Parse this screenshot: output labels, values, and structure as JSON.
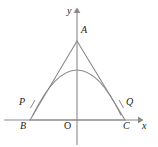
{
  "figure": {
    "type": "geometry-diagram",
    "canvas": {
      "width": 158,
      "height": 147,
      "background": "#ffffff"
    },
    "stroke_color": "#8a8a8a",
    "label_color": "#1a1a1a",
    "axes": {
      "x_axis": {
        "label": "x",
        "label_pos": {
          "x": 144,
          "y": 122
        },
        "line": {
          "x1": 4,
          "y1": 120,
          "x2": 140,
          "y2": 120
        },
        "arrow": "right"
      },
      "y_axis": {
        "label": "y",
        "label_pos": {
          "x": 67,
          "y": 8
        },
        "line": {
          "x1": 77,
          "y1": 144,
          "x2": 77,
          "y2": 9
        },
        "arrow": "up"
      },
      "origin": {
        "label": "O",
        "label_pos": {
          "x": 64,
          "y": 122
        },
        "point": {
          "x": 77,
          "y": 120
        }
      }
    },
    "points": [
      {
        "name": "A",
        "label": "A",
        "x": 77,
        "y": 41,
        "label_pos": {
          "x": 81,
          "y": 27
        }
      },
      {
        "name": "B",
        "label": "B",
        "x": 30,
        "y": 120,
        "label_pos": {
          "x": 21,
          "y": 122
        }
      },
      {
        "name": "C",
        "label": "C",
        "x": 125,
        "y": 120,
        "label_pos": {
          "x": 124,
          "y": 122
        }
      },
      {
        "name": "P",
        "label": "P",
        "x": 33,
        "y": 114,
        "label_pos": {
          "x": 20,
          "y": 98
        }
      },
      {
        "name": "Q",
        "label": "Q",
        "x": 121,
        "y": 114,
        "label_pos": {
          "x": 125,
          "y": 98
        }
      }
    ],
    "shapes": {
      "triangle": {
        "name": "triangle-ABC",
        "vertices": "77,41 30,120 125,120"
      },
      "parabola": {
        "name": "inscribed-parabola",
        "vertex": {
          "x": 77,
          "y": 70
        },
        "left_end": {
          "x": 33,
          "y": 115
        },
        "right_end": {
          "x": 121,
          "y": 115
        },
        "path": "M 33,115 Q 77,25 121,115"
      },
      "tick_marks": [
        {
          "name": "tick-P",
          "x1": 31,
          "y1": 107,
          "x2": 35,
          "y2": 101
        },
        {
          "name": "tick-Q",
          "x1": 123,
          "y1": 107,
          "x2": 119,
          "y2": 101
        }
      ]
    }
  }
}
